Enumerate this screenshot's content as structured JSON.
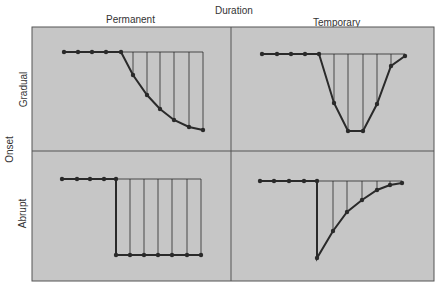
{
  "title": "Duration",
  "columns": [
    "Permanent",
    "Temporary"
  ],
  "row_axis_label": "Onset",
  "rows": [
    "Gradual",
    "Abrupt"
  ],
  "colors": {
    "panel_bg": "#c6c6c6",
    "line": "#2a2a2a",
    "frame": "#555555"
  },
  "panels": [
    {
      "name": "gradual-permanent",
      "baseline_y": 52,
      "pre_dots": [
        [
          64,
          52
        ],
        [
          78,
          52
        ],
        [
          92,
          52
        ],
        [
          106,
          52
        ]
      ],
      "curve": [
        [
          121,
          52
        ],
        [
          133,
          75
        ],
        [
          147,
          95
        ],
        [
          160,
          109
        ],
        [
          174,
          120
        ],
        [
          189,
          127
        ],
        [
          203,
          130
        ]
      ],
      "baseline_end_x": 203
    },
    {
      "name": "gradual-temporary",
      "baseline_y": 54,
      "pre_dots": [
        [
          262,
          54
        ],
        [
          277,
          54
        ],
        [
          291,
          54
        ],
        [
          305,
          54
        ]
      ],
      "curve": [
        [
          319,
          54
        ],
        [
          334,
          103
        ],
        [
          348,
          131
        ],
        [
          363,
          131
        ],
        [
          377,
          104
        ],
        [
          391,
          66
        ],
        [
          405,
          56
        ]
      ],
      "baseline_end_x": 405
    },
    {
      "name": "abrupt-permanent",
      "baseline_y": 179,
      "pre_dots": [
        [
          62,
          179
        ],
        [
          77,
          179
        ],
        [
          90,
          179
        ],
        [
          104,
          179
        ]
      ],
      "curve": [
        [
          116,
          179
        ],
        [
          116,
          255
        ],
        [
          130,
          255
        ],
        [
          144,
          255
        ],
        [
          158,
          255
        ],
        [
          172,
          255
        ],
        [
          187,
          255
        ],
        [
          201,
          255
        ]
      ],
      "baseline_end_x": 201
    },
    {
      "name": "abrupt-temporary",
      "baseline_y": 181,
      "pre_dots": [
        [
          260,
          181
        ],
        [
          274,
          181
        ],
        [
          289,
          181
        ],
        [
          304,
          181
        ]
      ],
      "curve": [
        [
          317,
          181
        ],
        [
          317,
          258
        ],
        [
          333,
          231
        ],
        [
          347,
          212
        ],
        [
          362,
          200
        ],
        [
          377,
          190
        ],
        [
          390,
          185
        ],
        [
          402,
          183
        ]
      ],
      "baseline_end_x": 402
    }
  ]
}
